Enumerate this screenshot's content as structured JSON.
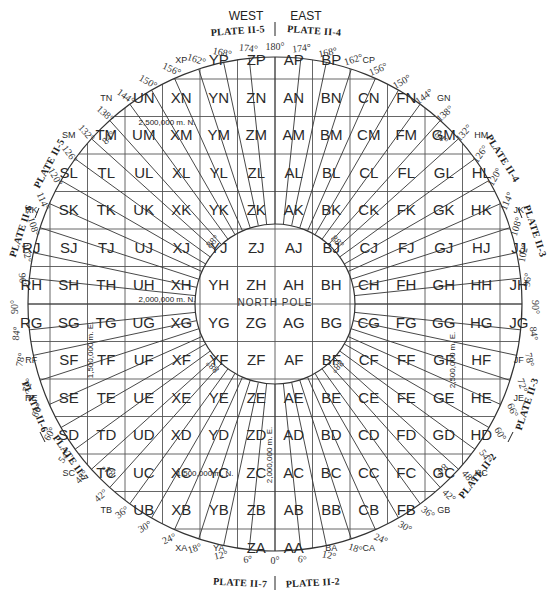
{
  "header": {
    "west_label": "WEST",
    "east_label": "EAST",
    "plate_top_left": "PLATE II-5",
    "plate_top_right": "PLATE II-4"
  },
  "plates": {
    "upper_left_a": "PLATE II-5",
    "upper_left_b": "PLATE II-6",
    "upper_right_a": "PLATE II-4",
    "upper_right_b": "PLATE II-3",
    "lower_left_a": "PLATE II-6",
    "lower_left_b": "PLATE II-7",
    "lower_right_a": "PLATE II-3",
    "lower_right_b": "PLATE II-2",
    "bottom_left": "PLATE II-7",
    "bottom_right": "PLATE II-2"
  },
  "center": {
    "pole_label": "NORTH POLE"
  },
  "notes": {
    "n2500": "2,500,000 m. N.",
    "n2000": "2,000,000 m. N.",
    "n1500": "1,500,000 m. N.",
    "e1500": "1,500,000 m. E.",
    "e2000": "2,000,000 m. E.",
    "e2500": "2,500,000 m. E."
  },
  "grid": {
    "center_x": 275,
    "center_y": 304,
    "cell": 37.5,
    "outer_radius": 247,
    "inner_radius": 80,
    "rows_north_to_south": [
      "P",
      "N",
      "M",
      "L",
      "K",
      "J",
      "H",
      "G",
      "F",
      "E",
      "D",
      "C",
      "B",
      "A"
    ],
    "columns_west_to_east": [
      "R",
      "S",
      "T",
      "U",
      "X",
      "Y",
      "Z",
      "A",
      "B",
      "C",
      "F",
      "G",
      "H",
      "J"
    ]
  },
  "cells": [
    {
      "id": "XP",
      "col": 4,
      "row": 0,
      "small": true
    },
    {
      "id": "YP",
      "col": 5,
      "row": 0
    },
    {
      "id": "ZP",
      "col": 6,
      "row": 0
    },
    {
      "id": "AP",
      "col": 7,
      "row": 0
    },
    {
      "id": "BP",
      "col": 8,
      "row": 0
    },
    {
      "id": "CP",
      "col": 9,
      "row": 0,
      "small": true
    },
    {
      "id": "TN",
      "col": 2,
      "row": 1,
      "small": true
    },
    {
      "id": "UN",
      "col": 3,
      "row": 1
    },
    {
      "id": "XN",
      "col": 4,
      "row": 1
    },
    {
      "id": "YN",
      "col": 5,
      "row": 1
    },
    {
      "id": "ZN",
      "col": 6,
      "row": 1
    },
    {
      "id": "AN",
      "col": 7,
      "row": 1
    },
    {
      "id": "BN",
      "col": 8,
      "row": 1
    },
    {
      "id": "CN",
      "col": 9,
      "row": 1
    },
    {
      "id": "FN",
      "col": 10,
      "row": 1
    },
    {
      "id": "GN",
      "col": 11,
      "row": 1,
      "small": true
    },
    {
      "id": "SM",
      "col": 1,
      "row": 2,
      "small": true
    },
    {
      "id": "TM",
      "col": 2,
      "row": 2
    },
    {
      "id": "UM",
      "col": 3,
      "row": 2
    },
    {
      "id": "XM",
      "col": 4,
      "row": 2
    },
    {
      "id": "YM",
      "col": 5,
      "row": 2
    },
    {
      "id": "ZM",
      "col": 6,
      "row": 2
    },
    {
      "id": "AM",
      "col": 7,
      "row": 2
    },
    {
      "id": "BM",
      "col": 8,
      "row": 2
    },
    {
      "id": "CM",
      "col": 9,
      "row": 2
    },
    {
      "id": "FM",
      "col": 10,
      "row": 2
    },
    {
      "id": "GM",
      "col": 11,
      "row": 2
    },
    {
      "id": "HM",
      "col": 12,
      "row": 2,
      "small": true
    },
    {
      "id": "SL",
      "col": 1,
      "row": 3
    },
    {
      "id": "TL",
      "col": 2,
      "row": 3
    },
    {
      "id": "UL",
      "col": 3,
      "row": 3
    },
    {
      "id": "XL",
      "col": 4,
      "row": 3
    },
    {
      "id": "YL",
      "col": 5,
      "row": 3
    },
    {
      "id": "ZL",
      "col": 6,
      "row": 3
    },
    {
      "id": "AL",
      "col": 7,
      "row": 3
    },
    {
      "id": "BL",
      "col": 8,
      "row": 3
    },
    {
      "id": "CL",
      "col": 9,
      "row": 3
    },
    {
      "id": "FL",
      "col": 10,
      "row": 3
    },
    {
      "id": "GL",
      "col": 11,
      "row": 3
    },
    {
      "id": "HL",
      "col": 12,
      "row": 3
    },
    {
      "id": "RK",
      "col": 0,
      "row": 4,
      "small": true
    },
    {
      "id": "SK",
      "col": 1,
      "row": 4
    },
    {
      "id": "TK",
      "col": 2,
      "row": 4
    },
    {
      "id": "UK",
      "col": 3,
      "row": 4
    },
    {
      "id": "XK",
      "col": 4,
      "row": 4
    },
    {
      "id": "YK",
      "col": 5,
      "row": 4
    },
    {
      "id": "ZK",
      "col": 6,
      "row": 4
    },
    {
      "id": "AK",
      "col": 7,
      "row": 4
    },
    {
      "id": "BK",
      "col": 8,
      "row": 4
    },
    {
      "id": "CK",
      "col": 9,
      "row": 4
    },
    {
      "id": "FK",
      "col": 10,
      "row": 4
    },
    {
      "id": "GK",
      "col": 11,
      "row": 4
    },
    {
      "id": "HK",
      "col": 12,
      "row": 4
    },
    {
      "id": "JK",
      "col": 13,
      "row": 4,
      "small": true
    },
    {
      "id": "RJ",
      "col": 0,
      "row": 5
    },
    {
      "id": "SJ",
      "col": 1,
      "row": 5
    },
    {
      "id": "TJ",
      "col": 2,
      "row": 5
    },
    {
      "id": "UJ",
      "col": 3,
      "row": 5
    },
    {
      "id": "XJ",
      "col": 4,
      "row": 5
    },
    {
      "id": "YJ",
      "col": 5,
      "row": 5
    },
    {
      "id": "ZJ",
      "col": 6,
      "row": 5
    },
    {
      "id": "AJ",
      "col": 7,
      "row": 5
    },
    {
      "id": "BJ",
      "col": 8,
      "row": 5
    },
    {
      "id": "CJ",
      "col": 9,
      "row": 5
    },
    {
      "id": "FJ",
      "col": 10,
      "row": 5
    },
    {
      "id": "GJ",
      "col": 11,
      "row": 5
    },
    {
      "id": "HJ",
      "col": 12,
      "row": 5
    },
    {
      "id": "JJ",
      "col": 13,
      "row": 5
    },
    {
      "id": "RH",
      "col": 0,
      "row": 6
    },
    {
      "id": "SH",
      "col": 1,
      "row": 6
    },
    {
      "id": "TH",
      "col": 2,
      "row": 6
    },
    {
      "id": "UH",
      "col": 3,
      "row": 6
    },
    {
      "id": "XH",
      "col": 4,
      "row": 6
    },
    {
      "id": "YH",
      "col": 5,
      "row": 6
    },
    {
      "id": "ZH",
      "col": 6,
      "row": 6
    },
    {
      "id": "AH",
      "col": 7,
      "row": 6
    },
    {
      "id": "BH",
      "col": 8,
      "row": 6
    },
    {
      "id": "CH",
      "col": 9,
      "row": 6
    },
    {
      "id": "FH",
      "col": 10,
      "row": 6
    },
    {
      "id": "GH",
      "col": 11,
      "row": 6
    },
    {
      "id": "HH",
      "col": 12,
      "row": 6
    },
    {
      "id": "JH",
      "col": 13,
      "row": 6
    },
    {
      "id": "RG",
      "col": 0,
      "row": 7
    },
    {
      "id": "SG",
      "col": 1,
      "row": 7
    },
    {
      "id": "TG",
      "col": 2,
      "row": 7
    },
    {
      "id": "UG",
      "col": 3,
      "row": 7
    },
    {
      "id": "XG",
      "col": 4,
      "row": 7
    },
    {
      "id": "YG",
      "col": 5,
      "row": 7
    },
    {
      "id": "ZG",
      "col": 6,
      "row": 7
    },
    {
      "id": "AG",
      "col": 7,
      "row": 7
    },
    {
      "id": "BG",
      "col": 8,
      "row": 7
    },
    {
      "id": "CG",
      "col": 9,
      "row": 7
    },
    {
      "id": "FG",
      "col": 10,
      "row": 7
    },
    {
      "id": "GG",
      "col": 11,
      "row": 7
    },
    {
      "id": "HG",
      "col": 12,
      "row": 7
    },
    {
      "id": "JG",
      "col": 13,
      "row": 7
    },
    {
      "id": "RF",
      "col": 0,
      "row": 8,
      "small": true
    },
    {
      "id": "SF",
      "col": 1,
      "row": 8
    },
    {
      "id": "TF",
      "col": 2,
      "row": 8
    },
    {
      "id": "UF",
      "col": 3,
      "row": 8
    },
    {
      "id": "XF",
      "col": 4,
      "row": 8
    },
    {
      "id": "YF",
      "col": 5,
      "row": 8
    },
    {
      "id": "ZF",
      "col": 6,
      "row": 8
    },
    {
      "id": "AF",
      "col": 7,
      "row": 8
    },
    {
      "id": "BF",
      "col": 8,
      "row": 8
    },
    {
      "id": "CF",
      "col": 9,
      "row": 8
    },
    {
      "id": "FF",
      "col": 10,
      "row": 8
    },
    {
      "id": "GF",
      "col": 11,
      "row": 8
    },
    {
      "id": "HF",
      "col": 12,
      "row": 8
    },
    {
      "id": "JF",
      "col": 13,
      "row": 8,
      "small": true
    },
    {
      "id": "RE",
      "col": 0,
      "row": 9,
      "small": true
    },
    {
      "id": "SE",
      "col": 1,
      "row": 9
    },
    {
      "id": "TE",
      "col": 2,
      "row": 9
    },
    {
      "id": "UE",
      "col": 3,
      "row": 9
    },
    {
      "id": "XE",
      "col": 4,
      "row": 9
    },
    {
      "id": "YE",
      "col": 5,
      "row": 9
    },
    {
      "id": "ZE",
      "col": 6,
      "row": 9
    },
    {
      "id": "AE",
      "col": 7,
      "row": 9
    },
    {
      "id": "BE",
      "col": 8,
      "row": 9
    },
    {
      "id": "CE",
      "col": 9,
      "row": 9
    },
    {
      "id": "FE",
      "col": 10,
      "row": 9
    },
    {
      "id": "GE",
      "col": 11,
      "row": 9
    },
    {
      "id": "HE",
      "col": 12,
      "row": 9
    },
    {
      "id": "JE",
      "col": 13,
      "row": 9,
      "small": true
    },
    {
      "id": "SD",
      "col": 1,
      "row": 10
    },
    {
      "id": "TD",
      "col": 2,
      "row": 10
    },
    {
      "id": "UD",
      "col": 3,
      "row": 10
    },
    {
      "id": "XD",
      "col": 4,
      "row": 10
    },
    {
      "id": "YD",
      "col": 5,
      "row": 10
    },
    {
      "id": "ZD",
      "col": 6,
      "row": 10
    },
    {
      "id": "AD",
      "col": 7,
      "row": 10
    },
    {
      "id": "BD",
      "col": 8,
      "row": 10
    },
    {
      "id": "CD",
      "col": 9,
      "row": 10
    },
    {
      "id": "FD",
      "col": 10,
      "row": 10
    },
    {
      "id": "GD",
      "col": 11,
      "row": 10
    },
    {
      "id": "HD",
      "col": 12,
      "row": 10
    },
    {
      "id": "SC",
      "col": 1,
      "row": 11,
      "small": true
    },
    {
      "id": "TC",
      "col": 2,
      "row": 11
    },
    {
      "id": "UC",
      "col": 3,
      "row": 11
    },
    {
      "id": "XC",
      "col": 4,
      "row": 11
    },
    {
      "id": "YC",
      "col": 5,
      "row": 11
    },
    {
      "id": "ZC",
      "col": 6,
      "row": 11
    },
    {
      "id": "AC",
      "col": 7,
      "row": 11
    },
    {
      "id": "BC",
      "col": 8,
      "row": 11
    },
    {
      "id": "CC",
      "col": 9,
      "row": 11
    },
    {
      "id": "FC",
      "col": 10,
      "row": 11
    },
    {
      "id": "GC",
      "col": 11,
      "row": 11
    },
    {
      "id": "HC",
      "col": 12,
      "row": 11,
      "small": true
    },
    {
      "id": "TB",
      "col": 2,
      "row": 12,
      "small": true
    },
    {
      "id": "UB",
      "col": 3,
      "row": 12
    },
    {
      "id": "XB",
      "col": 4,
      "row": 12
    },
    {
      "id": "YB",
      "col": 5,
      "row": 12
    },
    {
      "id": "ZB",
      "col": 6,
      "row": 12
    },
    {
      "id": "AB",
      "col": 7,
      "row": 12
    },
    {
      "id": "BB",
      "col": 8,
      "row": 12
    },
    {
      "id": "CB",
      "col": 9,
      "row": 12
    },
    {
      "id": "FB",
      "col": 10,
      "row": 12
    },
    {
      "id": "GB",
      "col": 11,
      "row": 12,
      "small": true
    },
    {
      "id": "XA",
      "col": 4,
      "row": 13,
      "small": true
    },
    {
      "id": "YA",
      "col": 5,
      "row": 13,
      "small": true
    },
    {
      "id": "ZA",
      "col": 6,
      "row": 13
    },
    {
      "id": "AA",
      "col": 7,
      "row": 13
    },
    {
      "id": "BA",
      "col": 8,
      "row": 13,
      "small": true
    },
    {
      "id": "CA",
      "col": 9,
      "row": 13,
      "small": true
    }
  ],
  "degree_labels": {
    "west_top": [
      "180°",
      "174°",
      "168°",
      "162°",
      "156°",
      "150°",
      "144°",
      "138°",
      "132°",
      "126°",
      "120°",
      "114°",
      "108°",
      "102°",
      "96°",
      "90°"
    ],
    "east_top": [
      "174°",
      "168°",
      "162°",
      "156°",
      "150°",
      "144°",
      "138°",
      "132°",
      "126°",
      "120°",
      "114°",
      "108°",
      "102°",
      "96°",
      "90°"
    ],
    "west_bottom": [
      "84°",
      "78°",
      "72°",
      "66°",
      "60°",
      "54°",
      "48°",
      "42°",
      "36°",
      "30°",
      "24°",
      "18°",
      "12°",
      "6°",
      "0°"
    ],
    "east_bottom": [
      "84°",
      "78°",
      "72°",
      "66°",
      "60°",
      "54°",
      "48°",
      "42°",
      "36°",
      "30°",
      "24°",
      "18°",
      "12°",
      "6°"
    ]
  },
  "latitude_marks": {
    "ring_84": "84°",
    "ring_88": "88°"
  }
}
